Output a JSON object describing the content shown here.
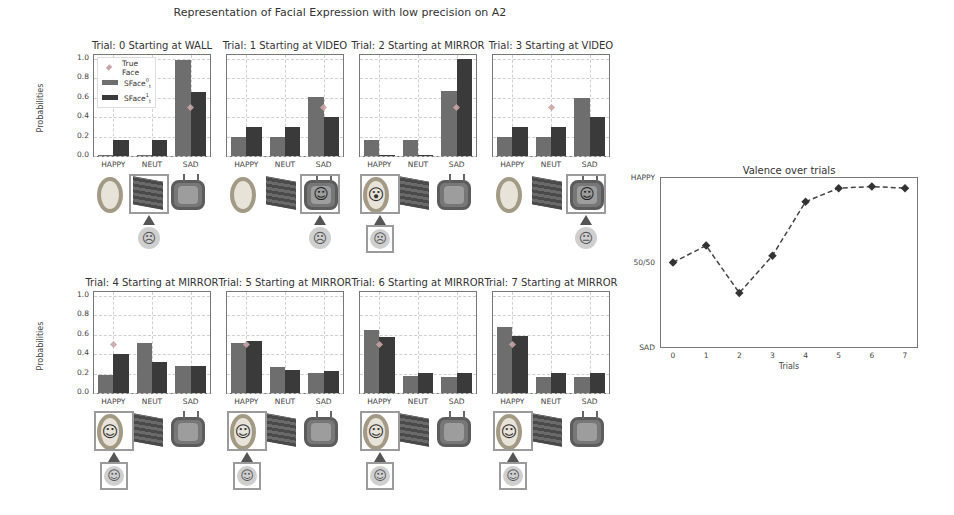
{
  "figure": {
    "suptitle": "Representation of Facial Expression with low precision on A2",
    "ylabel": "Probabilities",
    "legend": {
      "true_face": "True Face",
      "sface0_base": "SFace",
      "sface0_sup": "0",
      "sface0_sub": "t",
      "sface1_base": "SFace",
      "sface1_sup": "1",
      "sface1_sub": "t"
    },
    "colors": {
      "sface0": "#6e6e6e",
      "sface1": "#3a3a3a",
      "true_face": "#c9a5a5",
      "grid": "#cfcfcf"
    }
  },
  "chart_data": [
    {
      "type": "bar",
      "title": "Trial: 0 Starting at WALL",
      "categories": [
        "HAPPY",
        "NEUT",
        "SAD"
      ],
      "series": [
        {
          "name": "SFace^0_t",
          "values": [
            0.01,
            0.01,
            0.99
          ]
        },
        {
          "name": "SFace^1_t",
          "values": [
            0.17,
            0.17,
            0.66
          ]
        }
      ],
      "true_face": {
        "category": "SAD",
        "value": 0.5
      },
      "ylabel": "Probabilities",
      "ylim": [
        0,
        1.0
      ],
      "yticks": [
        "0.0",
        "0.2",
        "0.4",
        "0.6",
        "0.8",
        "1.0"
      ],
      "grid": true,
      "legend_position": "upper left"
    },
    {
      "type": "bar",
      "title": "Trial: 1 Starting at VIDEO",
      "categories": [
        "HAPPY",
        "NEUT",
        "SAD"
      ],
      "series": [
        {
          "name": "SFace^0_t",
          "values": [
            0.2,
            0.2,
            0.61
          ]
        },
        {
          "name": "SFace^1_t",
          "values": [
            0.3,
            0.3,
            0.4
          ]
        }
      ],
      "true_face": {
        "category": "SAD",
        "value": 0.5
      },
      "ylim": [
        0,
        1.0
      ],
      "grid": true
    },
    {
      "type": "bar",
      "title": "Trial: 2 Starting at MIRROR",
      "categories": [
        "HAPPY",
        "NEUT",
        "SAD"
      ],
      "series": [
        {
          "name": "SFace^0_t",
          "values": [
            0.17,
            0.17,
            0.67
          ]
        },
        {
          "name": "SFace^1_t",
          "values": [
            0.0,
            0.0,
            1.0
          ]
        }
      ],
      "true_face": {
        "category": "SAD",
        "value": 0.5
      },
      "ylim": [
        0,
        1.0
      ],
      "grid": true
    },
    {
      "type": "bar",
      "title": "Trial: 3 Starting at VIDEO",
      "categories": [
        "HAPPY",
        "NEUT",
        "SAD"
      ],
      "series": [
        {
          "name": "SFace^0_t",
          "values": [
            0.2,
            0.2,
            0.6
          ]
        },
        {
          "name": "SFace^1_t",
          "values": [
            0.3,
            0.3,
            0.4
          ]
        }
      ],
      "true_face": {
        "category": "NEUT",
        "value": 0.5
      },
      "ylim": [
        0,
        1.0
      ],
      "grid": true
    },
    {
      "type": "bar",
      "title": "Trial: 4 Starting at MIRROR",
      "categories": [
        "HAPPY",
        "NEUT",
        "SAD"
      ],
      "series": [
        {
          "name": "SFace^0_t",
          "values": [
            0.19,
            0.52,
            0.28
          ]
        },
        {
          "name": "SFace^1_t",
          "values": [
            0.4,
            0.32,
            0.28
          ]
        }
      ],
      "true_face": {
        "category": "HAPPY",
        "value": 0.5
      },
      "ylabel": "Probabilities",
      "ylim": [
        0,
        1.0
      ],
      "yticks": [
        "0.0",
        "0.2",
        "0.4",
        "0.6",
        "0.8",
        "1.0"
      ],
      "grid": true
    },
    {
      "type": "bar",
      "title": "Trial: 5 Starting at MIRROR",
      "categories": [
        "HAPPY",
        "NEUT",
        "SAD"
      ],
      "series": [
        {
          "name": "SFace^0_t",
          "values": [
            0.52,
            0.27,
            0.21
          ]
        },
        {
          "name": "SFace^1_t",
          "values": [
            0.54,
            0.24,
            0.23
          ]
        }
      ],
      "true_face": {
        "category": "HAPPY",
        "value": 0.5
      },
      "ylim": [
        0,
        1.0
      ],
      "grid": true
    },
    {
      "type": "bar",
      "title": "Trial: 6 Starting at MIRROR",
      "categories": [
        "HAPPY",
        "NEUT",
        "SAD"
      ],
      "series": [
        {
          "name": "SFace^0_t",
          "values": [
            0.65,
            0.18,
            0.17
          ]
        },
        {
          "name": "SFace^1_t",
          "values": [
            0.58,
            0.21,
            0.21
          ]
        }
      ],
      "true_face": {
        "category": "HAPPY",
        "value": 0.5
      },
      "ylim": [
        0,
        1.0
      ],
      "grid": true
    },
    {
      "type": "bar",
      "title": "Trial: 7 Starting at MIRROR",
      "categories": [
        "HAPPY",
        "NEUT",
        "SAD"
      ],
      "series": [
        {
          "name": "SFace^0_t",
          "values": [
            0.68,
            0.16,
            0.16
          ]
        },
        {
          "name": "SFace^1_t",
          "values": [
            0.59,
            0.21,
            0.21
          ]
        }
      ],
      "true_face": {
        "category": "HAPPY",
        "value": 0.5
      },
      "ylim": [
        0,
        1.0
      ],
      "grid": true
    },
    {
      "type": "line",
      "title": "Valence over trials",
      "xlabel": "Trials",
      "ylabel": "",
      "x": [
        0,
        1,
        2,
        3,
        4,
        5,
        6,
        7
      ],
      "series": [
        {
          "name": "valence",
          "values": [
            0.5,
            0.6,
            0.32,
            0.54,
            0.86,
            0.94,
            0.95,
            0.94
          ],
          "style": "dashed",
          "marker": "diamond"
        }
      ],
      "yticks": [
        "SAD",
        "50/50",
        "HAPPY"
      ],
      "ylim": [
        0,
        1
      ],
      "xticks": [
        "0",
        "1",
        "2",
        "3",
        "4",
        "5",
        "6",
        "7"
      ],
      "grid": false
    }
  ],
  "scenes": [
    {
      "selected": "wall",
      "mirror_face": "",
      "tv_face": "",
      "observed": "sad",
      "observed_framed": false
    },
    {
      "selected": "tv",
      "mirror_face": "",
      "tv_face": "happy",
      "observed": "sad",
      "observed_framed": false
    },
    {
      "selected": "mirror",
      "mirror_face": "shock",
      "tv_face": "",
      "observed": "sad",
      "observed_framed": true
    },
    {
      "selected": "tv",
      "mirror_face": "",
      "tv_face": "happy",
      "observed": "neutral",
      "observed_framed": false
    },
    {
      "selected": "mirror",
      "mirror_face": "happy",
      "tv_face": "",
      "observed": "happy",
      "observed_framed": true
    },
    {
      "selected": "mirror",
      "mirror_face": "happy",
      "tv_face": "",
      "observed": "happy",
      "observed_framed": true
    },
    {
      "selected": "mirror",
      "mirror_face": "happy",
      "tv_face": "",
      "observed": "happy",
      "observed_framed": true
    },
    {
      "selected": "mirror",
      "mirror_face": "happy",
      "tv_face": "",
      "observed": "happy",
      "observed_framed": true
    }
  ],
  "glyphs": {
    "sad": "☹",
    "happy": "☺",
    "neutral": "😐",
    "shock": "😮",
    "mirror_happy": "◡"
  }
}
